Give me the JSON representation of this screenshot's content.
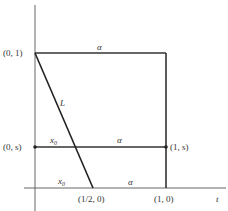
{
  "diagram": {
    "type": "geometric-homotopy-figure",
    "axis": {
      "horizontal_label": "t"
    },
    "points": [
      {
        "id": "p01",
        "label": "(0, 1)"
      },
      {
        "id": "p0s",
        "label": "(0, s)"
      },
      {
        "id": "p1s",
        "label": "(1, s)"
      },
      {
        "id": "phalf0",
        "label": "(1/2, 0)"
      },
      {
        "id": "p10",
        "label": "(1, 0)"
      }
    ],
    "edge_labels": {
      "top_alpha": "α",
      "middle_alpha": "α",
      "bottom_alpha": "α",
      "middle_x0": "x",
      "middle_x0_sub": "0",
      "bottom_x0": "x",
      "bottom_x0_sub": "0",
      "line_L": "L"
    },
    "colors": {
      "line": "#333333",
      "axis": "#555555",
      "text": "#333333",
      "background": "#ffffff"
    }
  }
}
